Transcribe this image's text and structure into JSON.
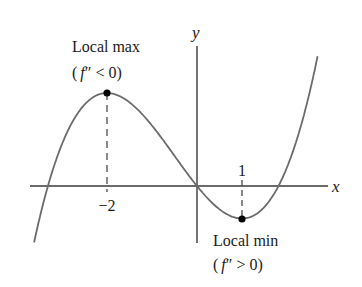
{
  "diagram": {
    "title": "",
    "axes": {
      "x_label": "x",
      "y_label": "y",
      "tick_labels": [
        {
          "value": -2,
          "text": "−2"
        },
        {
          "value": 1,
          "text": "1"
        }
      ]
    },
    "annotations": {
      "local_max": {
        "label": "Local max",
        "condition_prefix": "(",
        "condition_f": "f",
        "condition_rest": "″ < 0)",
        "x": -2
      },
      "local_min": {
        "label": "Local min",
        "condition_prefix": "(",
        "condition_f": "f",
        "condition_rest": "″ > 0)",
        "x": 1
      }
    },
    "colors": {
      "curve": "#6b6b6b",
      "axes": "#3a3a3a",
      "text": "#1a1a1a",
      "points": "#000000"
    }
  }
}
